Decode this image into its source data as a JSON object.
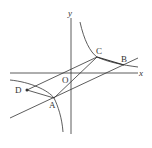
{
  "diagram": {
    "type": "coordinate-geometry",
    "axes": {
      "x_label": "x",
      "y_label": "y",
      "origin_label": "O"
    },
    "points": [
      {
        "label": "A",
        "x": 54,
        "y": 98
      },
      {
        "label": "B",
        "x": 124,
        "y": 65
      },
      {
        "label": "C",
        "x": 97,
        "y": 57
      },
      {
        "label": "D",
        "x": 27,
        "y": 90
      }
    ],
    "curves": [
      "hyperbola-upper-right-branch",
      "hyperbola-lower-left-branch"
    ],
    "lines": [
      "line-through-A-B",
      "line-through-D-C",
      "segment-A-C"
    ],
    "stroke_color": "#333333"
  }
}
